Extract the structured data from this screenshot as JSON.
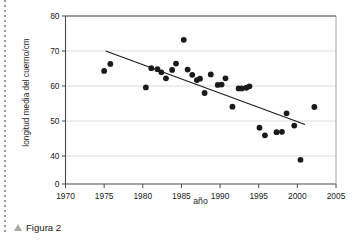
{
  "figure": {
    "caption": "Figura 2",
    "caption_marker_icon": "triangle-up-icon",
    "marker_color": "#a9a9a9"
  },
  "chart_data": {
    "type": "scatter",
    "title": "",
    "xlabel": "año",
    "ylabel": "longitud media del cuerno/cm",
    "xlim": [
      1970,
      2005
    ],
    "ylim": [
      0,
      80
    ],
    "y_axis_break": true,
    "grid": "horizontal",
    "grid_color": "#d9d9d9",
    "point_color": "#1a1a1a",
    "trendline_color": "#1a1a1a",
    "legend": "none",
    "xticks": [
      1970,
      1975,
      1980,
      1985,
      1990,
      1995,
      2000,
      2005
    ],
    "yticks": [
      0,
      40,
      50,
      60,
      70,
      80
    ],
    "x": [
      1975.0,
      1975.8,
      1980.4,
      1981.1,
      1981.9,
      1982.4,
      1983.0,
      1983.8,
      1984.3,
      1985.3,
      1985.8,
      1986.4,
      1987.0,
      1987.4,
      1988.0,
      1988.8,
      1989.7,
      1990.2,
      1990.7,
      1991.6,
      1992.4,
      1992.8,
      1993.4,
      1993.8,
      1995.1,
      1995.8,
      1997.3,
      1998.0,
      1998.6,
      1999.6,
      2000.4,
      2002.2
    ],
    "y": [
      64.3,
      66.3,
      59.6,
      65.1,
      64.8,
      63.9,
      62.2,
      64.6,
      66.4,
      73.2,
      64.7,
      63.2,
      61.7,
      62.1,
      58.0,
      63.3,
      60.3,
      60.4,
      62.2,
      54.1,
      59.3,
      59.3,
      59.5,
      59.9,
      48.1,
      45.9,
      46.8,
      46.9,
      52.2,
      48.7,
      38.9,
      54.0
    ],
    "series": [
      {
        "name": "longitud media del cuerno",
        "points": [
          [
            1975.0,
            64.3
          ],
          [
            1975.8,
            66.3
          ],
          [
            1980.4,
            59.6
          ],
          [
            1981.1,
            65.1
          ],
          [
            1981.9,
            64.8
          ],
          [
            1982.4,
            63.9
          ],
          [
            1983.0,
            62.2
          ],
          [
            1983.8,
            64.6
          ],
          [
            1984.3,
            66.4
          ],
          [
            1985.3,
            73.2
          ],
          [
            1985.8,
            64.7
          ],
          [
            1986.4,
            63.2
          ],
          [
            1987.0,
            61.7
          ],
          [
            1987.4,
            62.1
          ],
          [
            1988.0,
            58.0
          ],
          [
            1988.8,
            63.3
          ],
          [
            1989.7,
            60.3
          ],
          [
            1990.2,
            60.4
          ],
          [
            1990.7,
            62.2
          ],
          [
            1991.6,
            54.1
          ],
          [
            1992.4,
            59.3
          ],
          [
            1992.8,
            59.3
          ],
          [
            1993.4,
            59.5
          ],
          [
            1993.8,
            59.9
          ],
          [
            1995.1,
            48.1
          ],
          [
            1995.8,
            45.9
          ],
          [
            1997.3,
            46.8
          ],
          [
            1998.0,
            46.9
          ],
          [
            1998.6,
            52.2
          ],
          [
            1999.6,
            48.7
          ],
          [
            2000.4,
            38.9
          ],
          [
            2002.2,
            54.0
          ]
        ]
      }
    ],
    "trendline": {
      "x_start": 1975.2,
      "y_start": 70.0,
      "x_end": 2001.0,
      "y_end": 49.0
    },
    "xtick_labels": [
      "1970",
      "1975",
      "1980",
      "1985",
      "1990",
      "1995",
      "2000",
      "2005"
    ],
    "ytick_labels": [
      "0",
      "40",
      "50",
      "60",
      "70",
      "80"
    ]
  }
}
